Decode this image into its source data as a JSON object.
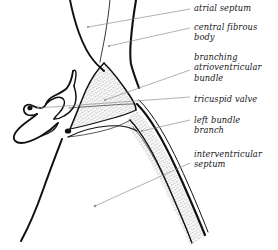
{
  "figure": {
    "style": "black-ink line drawing with stippled shading on white background",
    "background_color": "#ffffff",
    "ink_color": "#111111",
    "stipple_color": "#2b2b2b",
    "leader_line_color": "#8f8f95",
    "text_color": "#16161a",
    "width": 278,
    "height": 250
  },
  "labels": [
    {
      "id": "atrial-septum",
      "text": "atrial septum",
      "x": 194,
      "y": 3,
      "leader": {
        "x1": 190,
        "y1": 9,
        "x2": 88,
        "y2": 27,
        "dot": true
      }
    },
    {
      "id": "central-fibrous-body",
      "text": "central fibrous\nbody",
      "x": 194,
      "y": 22,
      "leader": {
        "x1": 190,
        "y1": 28,
        "x2": 109,
        "y2": 46,
        "dot": true
      }
    },
    {
      "id": "branching-atrioventricular-bundle",
      "text": "branching\natrioventricular\nbundle",
      "x": 194,
      "y": 52,
      "leader": {
        "x1": 190,
        "y1": 70,
        "x2": 105,
        "y2": 100,
        "dot": true
      }
    },
    {
      "id": "tricuspid-valve",
      "text": "tricuspid valve",
      "x": 194,
      "y": 94,
      "leader": {
        "x1": 190,
        "y1": 97,
        "x2": 38,
        "y2": 108,
        "dot": true
      }
    },
    {
      "id": "left-bundle-branch",
      "text": "left bundle\nbranch",
      "x": 194,
      "y": 115,
      "leader": {
        "x1": 190,
        "y1": 120,
        "x2": 142,
        "y2": 131,
        "dot": true
      }
    },
    {
      "id": "interventricular-septum",
      "text": "interventricular\nseptum",
      "x": 194,
      "y": 149,
      "leader": {
        "x1": 190,
        "y1": 163,
        "x2": 95,
        "y2": 206,
        "dot": true
      }
    }
  ]
}
